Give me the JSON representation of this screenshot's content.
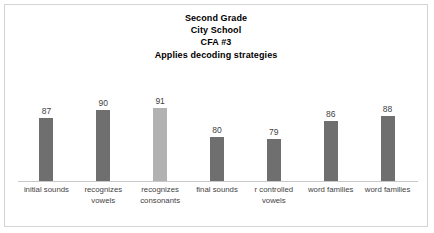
{
  "chart_data": {
    "type": "bar",
    "title": "Second Grade\nCity School\nCFA #3\nApplies decoding strategies",
    "title_lines": [
      "Second Grade",
      "City School",
      "CFA #3",
      "Applies decoding strategies"
    ],
    "categories": [
      "initial sounds",
      "recognizes vowels",
      "recognizes consonants",
      "final sounds",
      "r controlled vowels",
      "word families",
      "word families"
    ],
    "values": [
      87,
      90,
      91,
      80,
      79,
      86,
      88
    ],
    "value_labels": [
      "87",
      "90",
      "91",
      "80",
      "79",
      "86",
      "88"
    ],
    "xlabel": "",
    "ylabel": "",
    "ylim": [
      63,
      102
    ],
    "grid": false,
    "legend": false,
    "bar_colors": [
      "#706f6f",
      "#706f6f",
      "#b2b2b2",
      "#706f6f",
      "#706f6f",
      "#706f6f",
      "#706f6f"
    ],
    "highlighted_index": 2,
    "axis_color": "#c8c8c8",
    "border_color": "#d4d4d4",
    "background": "#ffffff"
  }
}
